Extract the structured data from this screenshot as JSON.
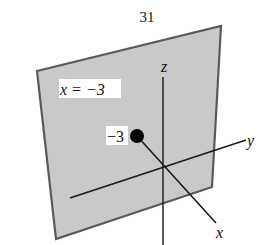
{
  "figure": {
    "number": "31",
    "plane_label": "x = −3",
    "point_label": "−3",
    "axes": {
      "x": "x",
      "y": "y",
      "z": "z"
    },
    "colors": {
      "plane_fill": "#c9c9c9",
      "plane_edge": "#5a5a5a",
      "axis": "#1a1a1a",
      "point": "#000000",
      "label_bg": "#ffffff"
    }
  }
}
